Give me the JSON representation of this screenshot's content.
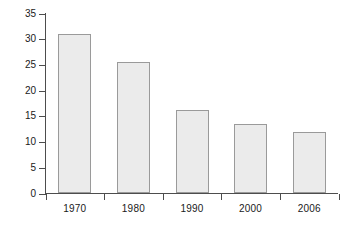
{
  "chart_data": {
    "type": "bar",
    "title": "",
    "subtitle": "",
    "xlabel": "",
    "ylabel": "Percent",
    "categories": [
      "1970",
      "1980",
      "1990",
      "2000",
      "2006"
    ],
    "values": [
      31,
      25.5,
      16.2,
      13.6,
      12
    ],
    "series": [
      {
        "name": "Percent",
        "values": [
          31,
          25.5,
          16.2,
          13.6,
          12
        ]
      }
    ],
    "ylim": [
      0,
      35
    ],
    "y_ticks": [
      0,
      5,
      10,
      15,
      20,
      25,
      30,
      35
    ],
    "y_tick_labels": [
      "0",
      "5",
      "10",
      "15",
      "20",
      "25",
      "30",
      "35"
    ],
    "x_tick_labels": [
      "1970",
      "1980",
      "1990",
      "2000",
      "2006"
    ],
    "grid": false,
    "legend": false,
    "legend_position": "none",
    "annotations": [],
    "colors": {
      "bar_fill": "#ebebeb",
      "bar_edge": "#9a9a9a",
      "axis": "#4d4d4d",
      "text": "#1a1a1a",
      "background": "#ffffff"
    }
  }
}
